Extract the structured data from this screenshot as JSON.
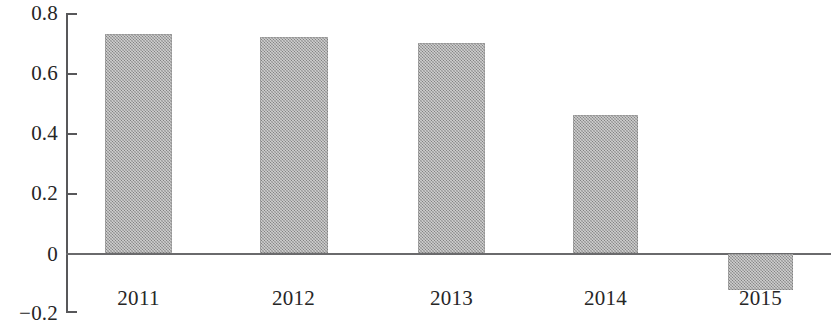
{
  "chart_data": {
    "type": "bar",
    "title": "",
    "subtitle": "",
    "xlabel": "",
    "ylabel": "",
    "categories": [
      "2011",
      "2012",
      "2013",
      "2014",
      "2015"
    ],
    "values": [
      0.73,
      0.72,
      0.7,
      0.46,
      -0.12
    ],
    "series": [
      {
        "name": "",
        "values": [
          0.73,
          0.72,
          0.7,
          0.46,
          -0.12
        ]
      }
    ],
    "ylim": [
      -0.2,
      0.8
    ],
    "y_ticks": [
      0.8,
      0.6,
      0.4,
      0.2,
      0,
      -0.2
    ],
    "y_tick_labels": [
      "0.8",
      "0.6",
      "0.4",
      "0.2",
      "0",
      "−0.2"
    ],
    "grid": false,
    "legend": false,
    "legend_position": "none",
    "annotations": [],
    "bar_color": "#9c9c9c",
    "axis_color": "#58585a",
    "background_color": "#ffffff",
    "zero_line": 0
  },
  "axis": {
    "y_labels": [
      {
        "text": "0.8",
        "value": 0.8
      },
      {
        "text": "0.6",
        "value": 0.6
      },
      {
        "text": "0.4",
        "value": 0.4
      },
      {
        "text": "0.2",
        "value": 0.2
      },
      {
        "text": "0",
        "value": 0
      },
      {
        "text": "−0.2",
        "value": -0.2
      }
    ],
    "x_labels": [
      "2011",
      "2012",
      "2013",
      "2014",
      "2015"
    ]
  }
}
